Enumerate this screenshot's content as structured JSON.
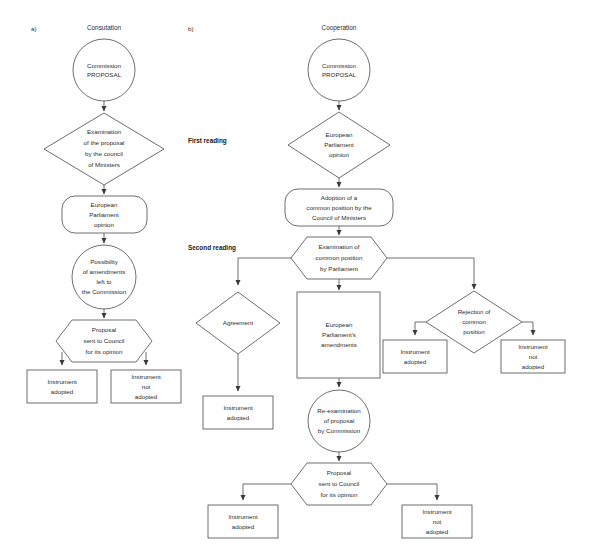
{
  "figure": {
    "background_color": "#ffffff",
    "stroke_color": "#4a4a4a",
    "text_color": "#2b2b2b"
  },
  "panels": [
    {
      "key": "a",
      "marker": "a)",
      "title": "Consutation",
      "stage_labels": [],
      "nodes": [
        {
          "id": "a_proposal",
          "shape": "circle",
          "lines": [
            "Commission",
            "PROPOSAL"
          ]
        },
        {
          "id": "a_examination",
          "shape": "diamond",
          "lines": [
            "Examination",
            "of the proposal",
            "by the council",
            "of Ministers"
          ]
        },
        {
          "id": "a_ep_opinion",
          "shape": "rounded",
          "lines": [
            "European",
            "Parliament",
            "opinion"
          ]
        },
        {
          "id": "a_possibility",
          "shape": "circle",
          "lines": [
            "Possibility",
            "of amendments",
            "left to",
            "the Commission"
          ]
        },
        {
          "id": "a_proposal_sent",
          "shape": "hexagon",
          "lines": [
            "Proposal",
            "sent to Council",
            "for its opinion"
          ]
        },
        {
          "id": "a_adopted",
          "shape": "rectangle",
          "lines": [
            "Instrument",
            "adopted"
          ]
        },
        {
          "id": "a_not_adopted",
          "shape": "rectangle",
          "lines": [
            "Instrument",
            "not",
            "adopted"
          ]
        }
      ]
    },
    {
      "key": "b",
      "marker": "b)",
      "title": "Cooperation",
      "stage_labels": [
        {
          "id": "b_first_reading",
          "text": "First reading"
        },
        {
          "id": "b_second_reading",
          "text": "Second reading"
        }
      ],
      "nodes": [
        {
          "id": "b_proposal",
          "shape": "circle",
          "lines": [
            "Commission",
            "PROPOSAL"
          ]
        },
        {
          "id": "b_ep_opinion",
          "shape": "diamond",
          "lines": [
            "European",
            "Parliament",
            "opinion"
          ]
        },
        {
          "id": "b_adoption",
          "shape": "rounded",
          "lines": [
            "Adoption of a",
            "common position by the",
            "Council of Ministers"
          ]
        },
        {
          "id": "b_examination",
          "shape": "hexagon",
          "lines": [
            "Examination of",
            "common position",
            "by Parliament"
          ]
        },
        {
          "id": "b_agreement",
          "shape": "diamond",
          "lines": [
            "Agreement"
          ]
        },
        {
          "id": "b_amendments",
          "shape": "rectangle",
          "lines": [
            "European",
            "Parliament's",
            "amendments"
          ]
        },
        {
          "id": "b_rejection",
          "shape": "diamond",
          "lines": [
            "Rejection of",
            "common",
            "position"
          ]
        },
        {
          "id": "b_rej_adopted",
          "shape": "rectangle",
          "lines": [
            "Instrument",
            "adopted"
          ]
        },
        {
          "id": "b_rej_not_adopted",
          "shape": "rectangle",
          "lines": [
            "Instrument",
            "not",
            "adopted"
          ]
        },
        {
          "id": "b_agree_adopted",
          "shape": "rectangle",
          "lines": [
            "Instrument",
            "adopted"
          ]
        },
        {
          "id": "b_reexamination",
          "shape": "circle",
          "lines": [
            "Re-examination",
            "of proposal",
            "by Commission"
          ]
        },
        {
          "id": "b_proposal_sent",
          "shape": "hexagon",
          "lines": [
            "Proposal",
            "sent to Council",
            "for its opinion"
          ]
        },
        {
          "id": "b_final_adopted",
          "shape": "rectangle",
          "lines": [
            "Instrument",
            "adopted"
          ]
        },
        {
          "id": "b_final_not_adopted",
          "shape": "rectangle",
          "lines": [
            "Instrument",
            "not",
            "adopted"
          ]
        }
      ]
    }
  ]
}
